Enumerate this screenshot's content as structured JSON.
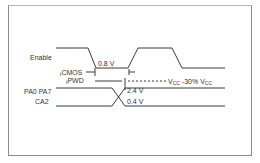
{
  "diagram": {
    "type": "timing-diagram",
    "signals": [
      {
        "name": "Enable",
        "label": "Enable"
      },
      {
        "name": "PA0-PA7 / CA2",
        "label_line1": "PA0 PA7",
        "label_line2": "CA2"
      }
    ],
    "annotations": {
      "enable_threshold": "0.8 V",
      "tcmos": {
        "prefix": "t",
        "sub": "CMOS"
      },
      "tpwd": {
        "prefix": "t",
        "sub": "PWD"
      },
      "vcc_ref": {
        "v1": "V",
        "v1_sub": "CC",
        "mid": " -30% V",
        "v2_sub": "CC"
      },
      "high_level": "2.4 V",
      "low_level": "0.4 V"
    },
    "line_color": "#3a3a3a"
  }
}
